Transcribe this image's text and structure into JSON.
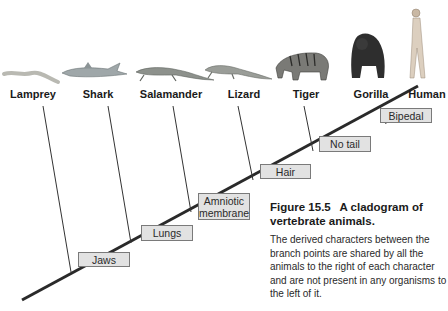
{
  "figure": {
    "number": "Figure 15.5",
    "title": "A cladogram of vertebrate animals.",
    "description": "The derived characters between the branch points are shared by all the animals to the right of each character and are not present in any organisms to the left of it."
  },
  "taxa": [
    {
      "name": "Lamprey",
      "icon": "lamprey-icon"
    },
    {
      "name": "Shark",
      "icon": "shark-icon"
    },
    {
      "name": "Salamander",
      "icon": "salamander-icon"
    },
    {
      "name": "Lizard",
      "icon": "lizard-icon"
    },
    {
      "name": "Tiger",
      "icon": "tiger-icon"
    },
    {
      "name": "Gorilla",
      "icon": "gorilla-icon"
    },
    {
      "name": "Human",
      "icon": "human-icon"
    }
  ],
  "characters": [
    {
      "label": "Jaws"
    },
    {
      "label": "Lungs"
    },
    {
      "label": "Amniotic membrane"
    },
    {
      "label": "Hair"
    },
    {
      "label": "No tail"
    },
    {
      "label": "Bipedal"
    }
  ],
  "colors": {
    "line": "#2a2a2a",
    "box_fill": "#e2e2e2",
    "box_border": "#7a7a7a",
    "text": "#1a1a1a"
  }
}
